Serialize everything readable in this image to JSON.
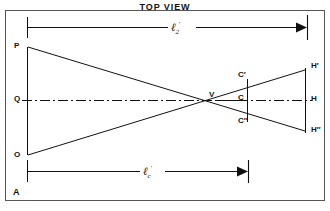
{
  "figure": {
    "title": "TOP VIEW",
    "points": {
      "p": "P",
      "q": "Q",
      "o": "O",
      "a": "A",
      "v": "V",
      "c_upper": "C′",
      "c_mid": "C",
      "c_lower": "C″",
      "h_upper": "H′",
      "h_mid": "H",
      "h_lower": "H″"
    },
    "dimensions": {
      "upper": {
        "symbol": "ℓ",
        "subscript": "2",
        "prime": "′"
      },
      "lower": {
        "symbol": "ℓ",
        "subscript": "c",
        "prime": "′"
      }
    },
    "colors": {
      "ink": "#111111",
      "background": "#ffffff"
    }
  }
}
